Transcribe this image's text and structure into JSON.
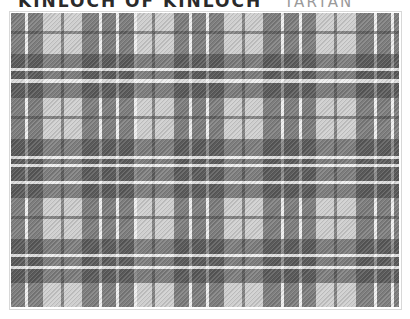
{
  "header": {
    "title": "KINLOCH OF KINLOCH",
    "subtitle": "TARTAN"
  },
  "tartan": {
    "colors": {
      "light": "#cfcfcf",
      "mid": "#8a8a8a",
      "dark": "#4a4a4a",
      "crossing_dark": "#3c3c3c",
      "thin_line": "#6a6a6a",
      "white_line": "#e8e8e8"
    },
    "origin": {
      "x": 10,
      "y": 12
    },
    "size": {
      "width": 388,
      "height": 294
    },
    "vertical_stripes": [
      {
        "x": 0,
        "w": 14,
        "c": "dark"
      },
      {
        "x": 14,
        "w": 3,
        "c": "white_line"
      },
      {
        "x": 17,
        "w": 15,
        "c": "dark"
      },
      {
        "x": 50,
        "w": 3,
        "c": "thin_line"
      },
      {
        "x": 71,
        "w": 17,
        "c": "dark"
      },
      {
        "x": 88,
        "w": 3,
        "c": "white_line"
      },
      {
        "x": 91,
        "w": 14,
        "c": "dark"
      },
      {
        "x": 105,
        "w": 3,
        "c": "white_line"
      },
      {
        "x": 108,
        "w": 15,
        "c": "dark"
      },
      {
        "x": 123,
        "w": 3,
        "c": "white_line"
      },
      {
        "x": 141,
        "w": 3,
        "c": "thin_line"
      },
      {
        "x": 163,
        "w": 15,
        "c": "dark"
      },
      {
        "x": 178,
        "w": 3,
        "c": "white_line"
      },
      {
        "x": 181,
        "w": 14,
        "c": "dark"
      },
      {
        "x": 195,
        "w": 3,
        "c": "white_line"
      },
      {
        "x": 198,
        "w": 15,
        "c": "dark"
      },
      {
        "x": 231,
        "w": 3,
        "c": "thin_line"
      },
      {
        "x": 252,
        "w": 18,
        "c": "dark"
      },
      {
        "x": 270,
        "w": 3,
        "c": "white_line"
      },
      {
        "x": 273,
        "w": 15,
        "c": "dark"
      },
      {
        "x": 288,
        "w": 3,
        "c": "white_line"
      },
      {
        "x": 291,
        "w": 14,
        "c": "dark"
      },
      {
        "x": 323,
        "w": 3,
        "c": "thin_line"
      },
      {
        "x": 345,
        "w": 18,
        "c": "dark"
      },
      {
        "x": 363,
        "w": 3,
        "c": "white_line"
      },
      {
        "x": 366,
        "w": 14,
        "c": "dark"
      },
      {
        "x": 380,
        "w": 3,
        "c": "white_line"
      },
      {
        "x": 383,
        "w": 5,
        "c": "dark"
      }
    ],
    "horizontal_stripes": [
      {
        "y": 18,
        "h": 3,
        "c": "thin_line"
      },
      {
        "y": 41,
        "h": 14,
        "c": "dark"
      },
      {
        "y": 55,
        "h": 3,
        "c": "white_line"
      },
      {
        "y": 58,
        "h": 8,
        "c": "dark"
      },
      {
        "y": 66,
        "h": 4,
        "c": "white_line"
      },
      {
        "y": 70,
        "h": 15,
        "c": "dark"
      },
      {
        "y": 103,
        "h": 3,
        "c": "thin_line"
      },
      {
        "y": 126,
        "h": 17,
        "c": "dark"
      },
      {
        "y": 143,
        "h": 3,
        "c": "white_line"
      },
      {
        "y": 146,
        "h": 5,
        "c": "dark"
      },
      {
        "y": 151,
        "h": 3,
        "c": "white_line"
      },
      {
        "y": 154,
        "h": 14,
        "c": "dark"
      },
      {
        "y": 168,
        "h": 3,
        "c": "white_line"
      },
      {
        "y": 171,
        "h": 14,
        "c": "dark"
      },
      {
        "y": 203,
        "h": 3,
        "c": "thin_line"
      },
      {
        "y": 226,
        "h": 15,
        "c": "dark"
      },
      {
        "y": 241,
        "h": 3,
        "c": "white_line"
      },
      {
        "y": 244,
        "h": 9,
        "c": "dark"
      },
      {
        "y": 253,
        "h": 3,
        "c": "white_line"
      },
      {
        "y": 256,
        "h": 14,
        "c": "dark"
      }
    ]
  }
}
